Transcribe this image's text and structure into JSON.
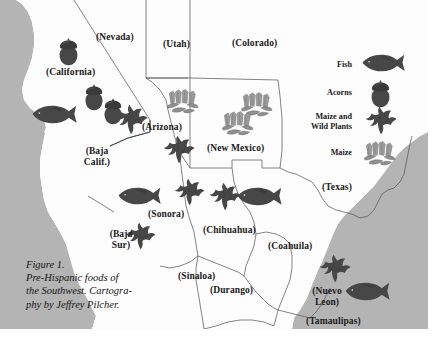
{
  "figure": {
    "caption_line1": "Figure 1.",
    "caption_line2": "Pre-Hispanic foods of",
    "caption_line3": "the Southwest. Cartogra-",
    "caption_line4": "phy by Jeffrey Pilcher."
  },
  "colors": {
    "ocean": "#b4b4b4",
    "land": "#fdfdfd",
    "border": "#4d4d4d",
    "icon_dark": "#474747",
    "icon_light": "#9b9b9b",
    "text": "#1a1a1a"
  },
  "legend": {
    "entries": [
      {
        "label": "Fish",
        "icon": "fish-icon"
      },
      {
        "label": "Acorns",
        "icon": "acorn-icon"
      },
      {
        "label": "Maize and\nWild Plants",
        "label_line1": "Maize and",
        "label_line2": "Wild Plants",
        "icon": "wild-plants-icon"
      },
      {
        "label": "Maize",
        "icon": "maize-icon"
      }
    ]
  },
  "map": {
    "regions": [
      {
        "name": "Nevada",
        "label": "(Nevada)",
        "x": 96,
        "y": 32
      },
      {
        "name": "Utah",
        "label": "(Utah)",
        "x": 163,
        "y": 39
      },
      {
        "name": "Colorado",
        "label": "(Colorado)",
        "x": 232,
        "y": 38
      },
      {
        "name": "California",
        "label": "(California)",
        "x": 46,
        "y": 67
      },
      {
        "name": "Arizona",
        "label": "(Arizona)",
        "x": 142,
        "y": 122
      },
      {
        "name": "New Mexico",
        "label": "(New Mexico)",
        "x": 207,
        "y": 143
      },
      {
        "name": "Texas",
        "label": "(Texas)",
        "x": 322,
        "y": 182
      },
      {
        "name": "Baja California",
        "label_line1": "(Baja",
        "label_line2": "Calif.)",
        "x": 77,
        "y": 146
      },
      {
        "name": "Baja California Sur",
        "label_line1": "(Baja",
        "label_line2": "Sur)",
        "x": 103,
        "y": 229
      },
      {
        "name": "Sonora",
        "label": "(Sonora)",
        "x": 148,
        "y": 209
      },
      {
        "name": "Chihuahua",
        "label": "(Chihuahua)",
        "x": 203,
        "y": 225
      },
      {
        "name": "Coahuila",
        "label": "(Coahuila)",
        "x": 268,
        "y": 241
      },
      {
        "name": "Sinaloa",
        "label": "(Sinaloa)",
        "x": 178,
        "y": 271
      },
      {
        "name": "Durango",
        "label": "(Durango)",
        "x": 210,
        "y": 285
      },
      {
        "name": "Nuevo Leon",
        "label_line1": "(Nuevo",
        "label_line2": "Leon)",
        "x": 310,
        "y": 286
      },
      {
        "name": "Tamaulipas",
        "label": "(Tamaulipas)",
        "x": 310,
        "y": 323
      }
    ],
    "icons": [
      {
        "type": "acorn-icon",
        "x": 58,
        "y": 38,
        "size": 26,
        "region": "California"
      },
      {
        "type": "acorn-icon",
        "x": 84,
        "y": 84,
        "size": 25,
        "region": "California"
      },
      {
        "type": "acorn-icon",
        "x": 103,
        "y": 98,
        "size": 25,
        "region": "California"
      },
      {
        "type": "fish-icon",
        "x": 32,
        "y": 104,
        "size": 42,
        "region": "California coast"
      },
      {
        "type": "wild-plants-icon",
        "x": 113,
        "y": 104,
        "size": 34,
        "region": "Baja California"
      },
      {
        "type": "maize-icon",
        "x": 166,
        "y": 88,
        "size": 32,
        "region": "Arizona"
      },
      {
        "type": "wild-plants-icon",
        "x": 162,
        "y": 135,
        "size": 32,
        "region": "Arizona"
      },
      {
        "type": "maize-icon",
        "x": 240,
        "y": 91,
        "size": 32,
        "region": "New Mexico"
      },
      {
        "type": "maize-icon",
        "x": 221,
        "y": 110,
        "size": 32,
        "region": "New Mexico"
      },
      {
        "type": "wild-plants-icon",
        "x": 173,
        "y": 178,
        "size": 32,
        "region": "Sonora"
      },
      {
        "type": "fish-icon",
        "x": 118,
        "y": 186,
        "size": 40,
        "region": "Gulf of California"
      },
      {
        "type": "wild-plants-icon",
        "x": 124,
        "y": 222,
        "size": 32,
        "region": "Sinaloa"
      },
      {
        "type": "wild-plants-icon",
        "x": 208,
        "y": 182,
        "size": 32,
        "region": "Chihuahua"
      },
      {
        "type": "fish-icon",
        "x": 237,
        "y": 186,
        "size": 42,
        "region": "Chihuahua"
      },
      {
        "type": "wild-plants-icon",
        "x": 318,
        "y": 254,
        "size": 32,
        "region": "Nuevo Leon"
      },
      {
        "type": "fish-icon",
        "x": 345,
        "y": 281,
        "size": 42,
        "region": "Gulf coast"
      }
    ]
  }
}
